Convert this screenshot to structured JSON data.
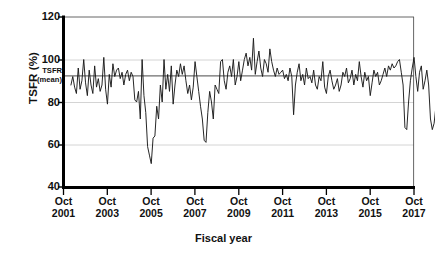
{
  "chart_data": {
    "type": "line",
    "title": "",
    "xlabel": "Fiscal year",
    "ylabel": "TSFR (%)",
    "ylim": [
      40,
      120
    ],
    "yticks": [
      40,
      60,
      80,
      100,
      120
    ],
    "ytick_labels": [
      "40",
      "60",
      "80",
      "100",
      "120"
    ],
    "grid": "horizontal",
    "legend": "none",
    "x_axis_type": "monthly-time-series",
    "xtick_labels": [
      [
        "Oct",
        "2001"
      ],
      [
        "Oct",
        "2003"
      ],
      [
        "Oct",
        "2005"
      ],
      [
        "Oct",
        "2007"
      ],
      [
        "Oct",
        "2009"
      ],
      [
        "Oct",
        "2011"
      ],
      [
        "Oct",
        "2013"
      ],
      [
        "Oct",
        "2015"
      ],
      [
        "Oct",
        "2017"
      ]
    ],
    "xlim_labels": [
      "Oct 2001",
      "Oct 2017"
    ],
    "annotations": [
      {
        "name": "mean-reference-line",
        "text_line1": "TSFR",
        "text_line2": "(mean)",
        "value": 90.0
      }
    ],
    "series": [
      {
        "name": "TSFR monthly",
        "color": "#1a1a1a",
        "x_start": "Feb 2002",
        "x_end": "Apr 2016",
        "values": [
          88,
          92,
          87,
          84,
          96,
          86,
          90,
          100,
          89,
          83,
          95,
          88,
          84,
          97,
          87,
          91,
          85,
          88,
          101,
          86,
          79,
          93,
          87,
          98,
          92,
          95,
          96,
          91,
          94,
          88,
          93,
          95,
          90,
          94,
          92,
          81,
          80,
          85,
          72,
          100,
          83,
          75,
          59,
          55,
          51,
          63,
          64,
          78,
          72,
          88,
          80,
          100,
          86,
          93,
          85,
          97,
          79,
          88,
          95,
          92,
          98,
          93,
          97,
          90,
          84,
          88,
          81,
          87,
          99,
          92,
          85,
          78,
          72,
          62,
          61,
          75,
          85,
          80,
          72,
          88,
          86,
          84,
          99,
          100,
          90,
          86,
          94,
          97,
          92,
          100,
          88,
          92,
          99,
          90,
          95,
          100,
          103,
          97,
          101,
          95,
          110,
          93,
          99,
          104,
          96,
          92,
          100,
          98,
          94,
          105,
          99,
          95,
          92,
          96,
          93,
          94,
          95,
          91,
          93,
          90,
          96,
          92,
          74,
          88,
          94,
          98,
          90,
          93,
          88,
          96,
          91,
          92,
          89,
          95,
          88,
          86,
          92,
          90,
          99,
          87,
          84,
          92,
          95,
          90,
          86,
          88,
          91,
          85,
          88,
          94,
          92,
          96,
          89,
          91,
          95,
          88,
          93,
          90,
          99,
          92,
          87,
          94,
          90,
          92,
          83,
          89,
          95,
          92,
          94,
          88,
          90,
          93,
          96,
          92,
          97,
          95,
          98,
          96,
          97,
          99,
          100,
          94,
          88,
          68,
          67,
          80,
          90,
          96,
          101,
          92,
          85,
          94,
          97,
          86,
          90,
          95,
          88,
          72,
          67,
          70,
          78,
          86,
          91,
          95
        ]
      }
    ]
  },
  "axis": {
    "y_title": "TSFR (%)",
    "x_title": "Fiscal year"
  }
}
